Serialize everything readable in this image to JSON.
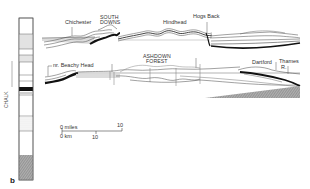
{
  "figure": {
    "panel_label": "b",
    "column": {
      "label": "CHALK",
      "units": [
        {
          "name": "top",
          "fill": "#ffffff"
        },
        {
          "name": "stippled-1",
          "fill": "#e4e4e4"
        },
        {
          "name": "stippled-2",
          "fill": "#e0e0e0"
        },
        {
          "name": "white-1",
          "fill": "#ffffff"
        },
        {
          "name": "white-2",
          "fill": "#ffffff"
        },
        {
          "name": "black-band",
          "fill": "#111111"
        },
        {
          "name": "thin-bands",
          "fill": "#dddddd"
        },
        {
          "name": "white-3",
          "fill": "#ffffff"
        },
        {
          "name": "dotted",
          "fill": "#f0f0f0"
        },
        {
          "name": "white-4",
          "fill": "#ffffff"
        },
        {
          "name": "hatched-base",
          "fill": "#9a9a9a"
        }
      ]
    },
    "upper_section": {
      "labels": {
        "chichester": "Chichester",
        "south_downs_1": "SOUTH",
        "south_downs_2": "DOWNS",
        "hindhead": "Hindhead",
        "hogs_back": "Hogs Back"
      }
    },
    "lower_section": {
      "labels": {
        "beachy_head": "nr. Beachy Head",
        "ashdown_1": "ASHDOWN",
        "ashdown_2": "FOREST",
        "dartford": "Dartford",
        "thames_1": "Thames",
        "thames_2": "R."
      }
    },
    "scale_bar": {
      "miles_label": "0 miles",
      "miles_end": "10",
      "km_label": "0 km",
      "km_mid": "10"
    }
  },
  "colors": {
    "line": "#333333",
    "black_bed": "#111111",
    "stipple": "#d8d8d8",
    "hatch": "#8a8a8a"
  }
}
